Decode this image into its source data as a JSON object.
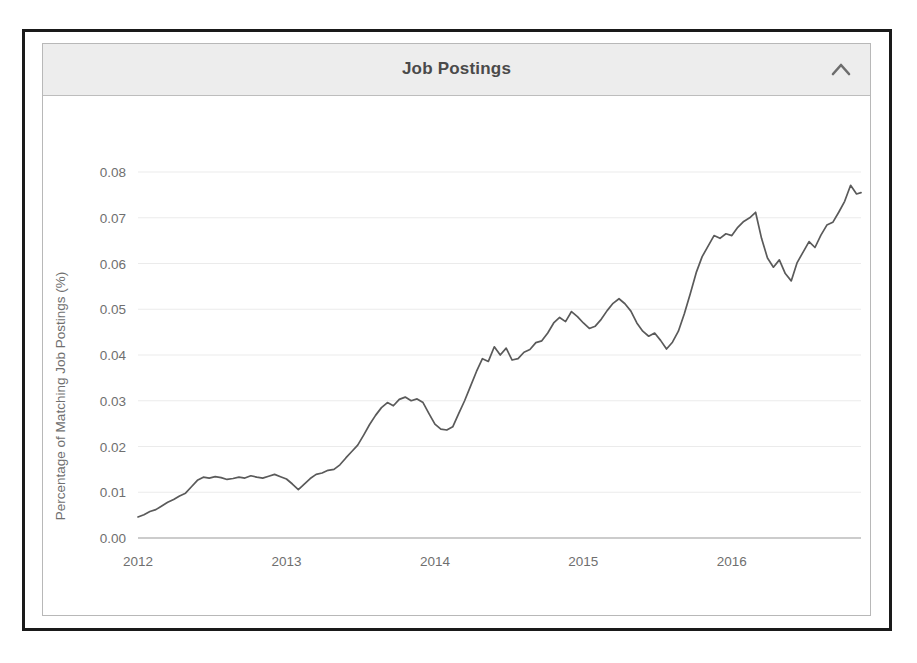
{
  "panel": {
    "title": "Job Postings",
    "collapse_icon": "chevron-up-icon"
  },
  "chart_data": {
    "type": "line",
    "title": "Job Postings",
    "xlabel": "",
    "ylabel": "Percentage of Matching Job Postings (%)",
    "xlim": [
      2012.0,
      2016.87
    ],
    "ylim": [
      0.0,
      0.0835
    ],
    "grid": true,
    "legend": null,
    "line_color": "#5a5a5a",
    "xticks": [
      "2012",
      "2013",
      "2014",
      "2015",
      "2016"
    ],
    "xtick_values": [
      2012,
      2013,
      2014,
      2015,
      2016
    ],
    "yticks": [
      "0.00",
      "0.01",
      "0.02",
      "0.03",
      "0.04",
      "0.05",
      "0.06",
      "0.07",
      "0.08"
    ],
    "ytick_values": [
      0.0,
      0.01,
      0.02,
      0.03,
      0.04,
      0.05,
      0.06,
      0.07,
      0.08
    ],
    "series": [
      {
        "name": "Percentage of Matching Job Postings",
        "x": [
          2012.0,
          2012.04,
          2012.08,
          2012.12,
          2012.16,
          2012.2,
          2012.24,
          2012.28,
          2012.32,
          2012.36,
          2012.4,
          2012.44,
          2012.48,
          2012.52,
          2012.56,
          2012.6,
          2012.64,
          2012.68,
          2012.72,
          2012.76,
          2012.8,
          2012.84,
          2012.88,
          2012.92,
          2012.96,
          2013.0,
          2013.04,
          2013.08,
          2013.12,
          2013.16,
          2013.2,
          2013.24,
          2013.28,
          2013.32,
          2013.36,
          2013.4,
          2013.44,
          2013.48,
          2013.52,
          2013.56,
          2013.6,
          2013.64,
          2013.68,
          2013.72,
          2013.76,
          2013.8,
          2013.84,
          2013.88,
          2013.92,
          2013.96,
          2014.0,
          2014.04,
          2014.08,
          2014.12,
          2014.16,
          2014.2,
          2014.24,
          2014.28,
          2014.32,
          2014.36,
          2014.4,
          2014.44,
          2014.48,
          2014.52,
          2014.56,
          2014.6,
          2014.64,
          2014.68,
          2014.72,
          2014.76,
          2014.8,
          2014.84,
          2014.88,
          2014.92,
          2014.96,
          2015.0,
          2015.04,
          2015.08,
          2015.12,
          2015.16,
          2015.2,
          2015.24,
          2015.28,
          2015.32,
          2015.36,
          2015.4,
          2015.44,
          2015.48,
          2015.52,
          2015.56,
          2015.6,
          2015.64,
          2015.68,
          2015.72,
          2015.76,
          2015.8,
          2015.84,
          2015.88,
          2015.92,
          2015.96,
          2016.0,
          2016.04,
          2016.08,
          2016.12,
          2016.16,
          2016.2,
          2016.24,
          2016.28,
          2016.32,
          2016.36,
          2016.4,
          2016.44,
          2016.48,
          2016.52,
          2016.56,
          2016.6,
          2016.64,
          2016.68,
          2016.72,
          2016.76,
          2016.8,
          2016.84,
          2016.87
        ],
        "y": [
          0.0046,
          0.0051,
          0.0058,
          0.0062,
          0.007,
          0.0078,
          0.0084,
          0.0092,
          0.0098,
          0.0112,
          0.0126,
          0.0133,
          0.0131,
          0.0134,
          0.0132,
          0.0128,
          0.013,
          0.0133,
          0.0131,
          0.0136,
          0.0133,
          0.0131,
          0.0135,
          0.0139,
          0.0134,
          0.0129,
          0.0118,
          0.0106,
          0.0118,
          0.013,
          0.0139,
          0.0142,
          0.0148,
          0.015,
          0.016,
          0.0175,
          0.0189,
          0.0203,
          0.0225,
          0.0248,
          0.0268,
          0.0285,
          0.0296,
          0.0289,
          0.0303,
          0.0308,
          0.03,
          0.0304,
          0.0296,
          0.0272,
          0.0249,
          0.0238,
          0.0236,
          0.0243,
          0.0272,
          0.03,
          0.0332,
          0.0364,
          0.0392,
          0.0386,
          0.0418,
          0.04,
          0.0415,
          0.0389,
          0.0392,
          0.0406,
          0.0412,
          0.0427,
          0.0431,
          0.0448,
          0.047,
          0.0482,
          0.0473,
          0.0495,
          0.0484,
          0.047,
          0.0458,
          0.0463,
          0.0478,
          0.0497,
          0.0513,
          0.0523,
          0.0512,
          0.0496,
          0.047,
          0.0452,
          0.0441,
          0.0448,
          0.0432,
          0.0413,
          0.0428,
          0.0452,
          0.049,
          0.0534,
          0.058,
          0.0615,
          0.0638,
          0.0661,
          0.0655,
          0.0665,
          0.0661,
          0.0679,
          0.0692,
          0.07,
          0.0712,
          0.0721,
          0.0718,
          0.0705,
          0.0718,
          0.074,
          0.0762,
          0.079,
          0.0772,
          0.0729,
          0.0724,
          0.0688,
          0.0706,
          0.0673,
          0.0688,
          0.0713,
          0.07,
          0.0679,
          0.0665
        ]
      }
    ],
    "series_tail": {
      "x": [
        2016.2,
        2016.24,
        2016.28,
        2016.32,
        2016.36,
        2016.4,
        2016.44,
        2016.48,
        2016.52,
        2016.56,
        2016.6,
        2016.64,
        2016.68,
        2016.72,
        2016.76,
        2016.8,
        2016.84,
        2016.87
      ],
      "y": [
        0.0655,
        0.0612,
        0.0592,
        0.0608,
        0.0578,
        0.0562,
        0.0602,
        0.0625,
        0.0648,
        0.0635,
        0.0662,
        0.0684,
        0.069,
        0.0712,
        0.0736,
        0.0771,
        0.0752,
        0.0755
      ]
    }
  }
}
